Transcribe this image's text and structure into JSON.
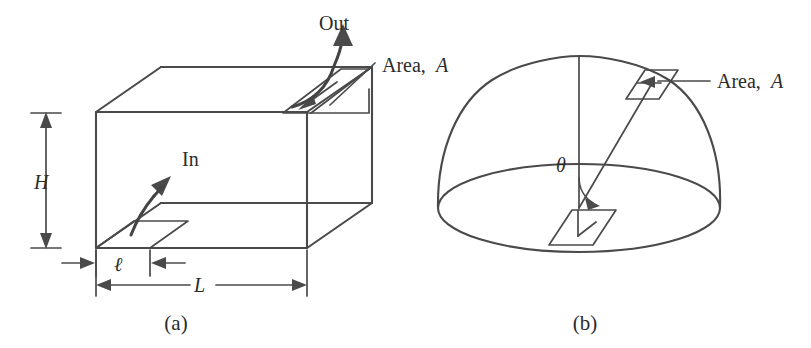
{
  "figure": {
    "background_color": "#ffffff",
    "ink_color": "#4a4a4a",
    "text_color": "#2b2b2b",
    "width": 811,
    "height": 348
  },
  "panel_a": {
    "caption": "(a)",
    "labels": {
      "out": "Out",
      "in": "In",
      "area": "Area, A",
      "area_text": "Area,",
      "area_symbol": "A",
      "height": "H",
      "length": "L",
      "thickness": "ℓ"
    }
  },
  "panel_b": {
    "caption": "(b)",
    "labels": {
      "area": "Area, A",
      "area_text": "Area,",
      "area_symbol": "A",
      "theta": "θ"
    }
  }
}
